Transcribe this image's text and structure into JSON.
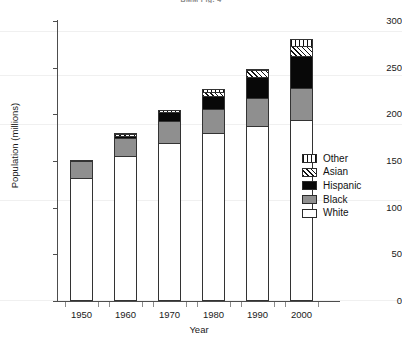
{
  "title": "BMM Fig. 4",
  "chart_data": {
    "type": "bar",
    "stacked": true,
    "title": "BMM Fig. 4",
    "xlabel": "Year",
    "ylabel": "Population (millions)",
    "categories": [
      "1950",
      "1960",
      "1970",
      "1980",
      "1990",
      "2000"
    ],
    "ylim": [
      0,
      300
    ],
    "yticks": [
      0,
      50,
      100,
      150,
      200,
      250,
      300
    ],
    "grid": false,
    "legend_position": "right",
    "series": [
      {
        "name": "White",
        "values": [
          132,
          155,
          169,
          180,
          187,
          194
        ],
        "fill": "#ffffff",
        "pattern": "solid"
      },
      {
        "name": "Black",
        "values": [
          18,
          20,
          24,
          26,
          30,
          34
        ],
        "fill": "#8f8f8f",
        "pattern": "solid"
      },
      {
        "name": "Hispanic",
        "values": [
          1,
          2,
          9,
          14,
          23,
          35
        ],
        "fill": "#080808",
        "pattern": "solid"
      },
      {
        "name": "Asian",
        "values": [
          0,
          2,
          1,
          4,
          7,
          10
        ],
        "fill": "#ffffff",
        "pattern": "diagonal-hatch"
      },
      {
        "name": "Other",
        "values": [
          0,
          1,
          1,
          3,
          2,
          8
        ],
        "fill": "#ffffff",
        "pattern": "vertical-hatch"
      }
    ],
    "totals": [
      151,
      180,
      204,
      227,
      249,
      281
    ]
  },
  "axes": {
    "ytick_labels": [
      "300",
      "250",
      "200",
      "150",
      "100",
      "50",
      "0"
    ],
    "xtick_labels": [
      "1950",
      "1960",
      "1970",
      "1980",
      "1990",
      "2000"
    ],
    "ylabel": "Population (millions)",
    "xlabel": "Year"
  },
  "legend": {
    "items": [
      {
        "label": "Other",
        "swatch": "vertical-hatch"
      },
      {
        "label": "Asian",
        "swatch": "diagonal-hatch"
      },
      {
        "label": "Hispanic",
        "swatch": "solid-black"
      },
      {
        "label": "Black",
        "swatch": "solid-gray"
      },
      {
        "label": "White",
        "swatch": "solid-white"
      }
    ]
  },
  "colors": {
    "white_segment": "#ffffff",
    "black_segment": "#8f8f8f",
    "hispanic_segment": "#080808",
    "axis": "#4d4d4d",
    "text": "#1a1a1a"
  }
}
